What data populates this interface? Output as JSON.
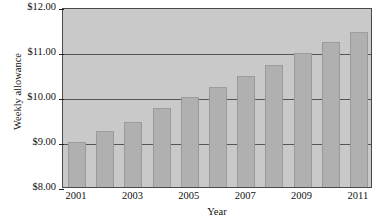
{
  "chart_data": {
    "type": "bar",
    "title": "",
    "xlabel": "Year",
    "ylabel": "Weekly allowance",
    "categories": [
      "2001",
      "2002",
      "2003",
      "2004",
      "2005",
      "2006",
      "2007",
      "2008",
      "2009",
      "2010",
      "2011"
    ],
    "values": [
      9.0,
      9.25,
      9.45,
      9.75,
      10.0,
      10.22,
      10.47,
      10.72,
      10.98,
      11.22,
      11.45
    ],
    "ylim": [
      8.0,
      12.0
    ],
    "ytick_values": [
      12.0,
      11.0,
      10.0,
      9.0,
      8.0
    ],
    "ytick_labels": [
      "$12.00",
      "$11.00",
      "$10.00",
      "$9.00",
      "$8.00"
    ],
    "xtick_labels": [
      "2001",
      "2003",
      "2005",
      "2007",
      "2009",
      "2011"
    ],
    "xtick_categories": [
      "2001",
      "2003",
      "2005",
      "2007",
      "2009",
      "2011"
    ],
    "grid": true,
    "legend": "none",
    "bar_color": "#b0b0b0",
    "plot_background": "#c9c9c9",
    "axis_color": "#4a4a4a",
    "gridline_color": "#555555"
  }
}
